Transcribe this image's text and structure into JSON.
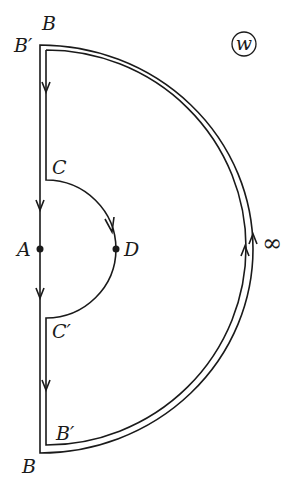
{
  "diagram": {
    "plane_label": "w",
    "infinity_label": "∞",
    "points": {
      "B_top": "B",
      "B_prime_top": "B′",
      "C": "C",
      "A": "A",
      "D": "D",
      "C_prime": "C′",
      "B_prime_bottom": "B′",
      "B_bottom": "B"
    },
    "colors": {
      "stroke": "#1a1a1a",
      "background": "#ffffff"
    }
  }
}
